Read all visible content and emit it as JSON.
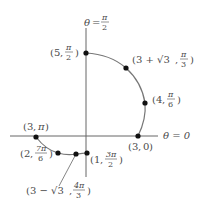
{
  "diagram": {
    "type": "polar-graph",
    "axes": {
      "polar_axis_label": "θ = 0",
      "vertical_axis_label": {
        "theta": "θ",
        "eq": "=",
        "num": "π",
        "den": "2"
      }
    },
    "curve": {
      "color": "#777777"
    },
    "points": [
      {
        "id": "p1",
        "r": "5",
        "theta_num": "π",
        "theta_den": "2"
      },
      {
        "id": "p2",
        "r": "3 + √3",
        "theta_num": "π",
        "theta_den": "3"
      },
      {
        "id": "p3",
        "r": "4",
        "theta_num": "π",
        "theta_den": "6"
      },
      {
        "id": "p4",
        "r": "3",
        "theta": "0"
      },
      {
        "id": "p5",
        "r": "3",
        "theta": "π"
      },
      {
        "id": "p6",
        "r": "2",
        "theta_num": "7π",
        "theta_den": "6"
      },
      {
        "id": "p7",
        "r": "3 − √3",
        "theta_num": "4π",
        "theta_den": "3"
      },
      {
        "id": "p8",
        "r": "1",
        "theta_num": "3π",
        "theta_den": "2"
      }
    ],
    "colors": {
      "axis": "#666666",
      "point": "#111111",
      "text": "#4a4a4a"
    }
  }
}
